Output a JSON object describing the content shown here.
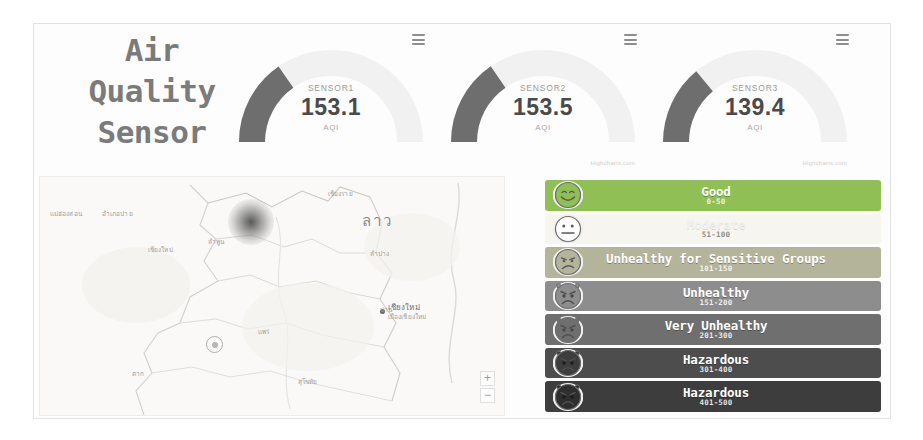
{
  "app": {
    "title_lines": [
      "Air",
      "Quality",
      "Sensor"
    ]
  },
  "gauges": [
    {
      "menu_icon": "hamburger-menu-icon",
      "name": "SENSOR1",
      "value": "153.1",
      "unit": "AQI",
      "value_number": 153.1,
      "min": 0,
      "max": 500,
      "fill_color": "#6e6e6e",
      "track_color": "#f1f1f1",
      "credit": ""
    },
    {
      "menu_icon": "hamburger-menu-icon",
      "name": "SENSOR2",
      "value": "153.5",
      "unit": "AQI",
      "value_number": 153.5,
      "min": 0,
      "max": 500,
      "fill_color": "#6e6e6e",
      "track_color": "#f1f1f1",
      "credit": "Highcharts.com"
    },
    {
      "menu_icon": "hamburger-menu-icon",
      "name": "SENSOR3",
      "value": "139.4",
      "unit": "AQI",
      "value_number": 139.4,
      "min": 0,
      "max": 500,
      "fill_color": "#6e6e6e",
      "track_color": "#f1f1f1",
      "credit": "Highcharts.com"
    }
  ],
  "map": {
    "country_label": "ลาว",
    "city_label_line1": "เชียงใหม่",
    "city_label_line2": "เมืองเชียงใหม่",
    "labels": [
      {
        "text": "แม่ฮ่องสอน",
        "x": 10,
        "y": 32
      },
      {
        "text": "อำเภอปาย",
        "x": 62,
        "y": 32
      },
      {
        "text": "เชียงราย",
        "x": 288,
        "y": 10
      },
      {
        "text": "เชียงใหม่",
        "x": 108,
        "y": 68
      },
      {
        "text": "ลำพูน",
        "x": 168,
        "y": 60
      },
      {
        "text": "ลำปาง",
        "x": 330,
        "y": 72
      },
      {
        "text": "แพร่",
        "x": 218,
        "y": 150
      },
      {
        "text": "ตาก",
        "x": 92,
        "y": 192
      },
      {
        "text": "สุโขทัย",
        "x": 258,
        "y": 200
      },
      {
        "text": "น่าน",
        "x": 340,
        "y": 128
      }
    ],
    "zoom_in_label": "+",
    "zoom_out_label": "−"
  },
  "aqi_legend": [
    {
      "name": "Good",
      "range": "0-50",
      "color": "#8fbf55",
      "face": "happy",
      "style": "dark"
    },
    {
      "name": "Moderate",
      "range": "51-100",
      "color": "#f7f5ef",
      "face": "neutral",
      "style": "light"
    },
    {
      "name": "Unhealthy for Sensitive Groups",
      "range": "101-150",
      "color": "#b4b49a",
      "face": "frown",
      "style": "dark"
    },
    {
      "name": "Unhealthy",
      "range": "151-200",
      "color": "#8d8d8d",
      "face": "angry",
      "style": "dark"
    },
    {
      "name": "Very Unhealthy",
      "range": "201-300",
      "color": "#6f6f6f",
      "face": "angry-dark",
      "style": "dark"
    },
    {
      "name": "Hazardous",
      "range": "301-400",
      "color": "#4d4d4d",
      "face": "skull",
      "style": "dark"
    },
    {
      "name": "Hazardous",
      "range": "401-500",
      "color": "#3d3d3d",
      "face": "skull-dark",
      "style": "dark"
    }
  ]
}
